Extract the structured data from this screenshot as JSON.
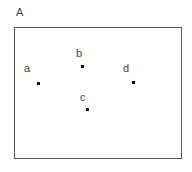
{
  "figure": {
    "panel_label": "A",
    "points": [
      {
        "label": "a",
        "label_x": 24,
        "label_y": 63,
        "dot_x": 37,
        "dot_y": 82
      },
      {
        "label": "b",
        "label_x": 76,
        "label_y": 48,
        "dot_x": 81,
        "dot_y": 65
      },
      {
        "label": "c",
        "label_x": 80,
        "label_y": 92,
        "dot_x": 86,
        "dot_y": 108
      },
      {
        "label": "d",
        "label_x": 123,
        "label_y": 63,
        "dot_x": 132,
        "dot_y": 81
      }
    ]
  }
}
